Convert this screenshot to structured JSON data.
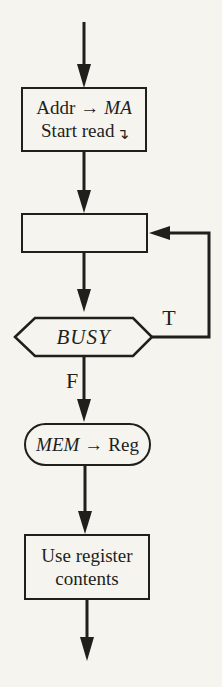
{
  "page": {
    "background": "#f6f4ef",
    "ink": "#211f1c"
  },
  "flowchart": {
    "box_addr": {
      "line1_op": "Addr",
      "line1_arrow": "→",
      "line1_dest": "MA",
      "line2": "Start read",
      "line2_symbol": "↴"
    },
    "box_wait": {
      "label": ""
    },
    "decision_busy": {
      "label": "BUSY",
      "branch_true": "T",
      "branch_false": "F"
    },
    "pill_mem": {
      "source": "MEM",
      "arrow": "→",
      "dest": "Reg"
    },
    "box_use": {
      "line1": "Use register",
      "line2": "contents"
    }
  }
}
